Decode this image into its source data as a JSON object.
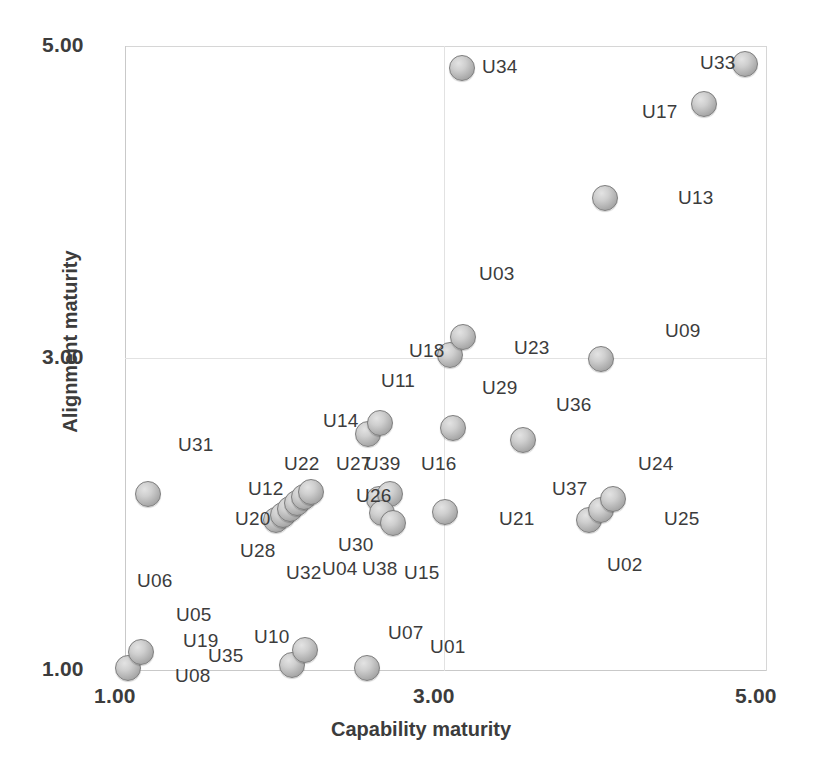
{
  "chart_data": {
    "type": "scatter",
    "title": "",
    "xlabel": "Capability maturity",
    "ylabel": "Alignment maturity",
    "xlim": [
      1.0,
      5.0
    ],
    "ylim": [
      1.0,
      5.0
    ],
    "xticks": [
      "1.00",
      "3.00",
      "5.00"
    ],
    "yticks": [
      "1.00",
      "3.00",
      "5.00"
    ],
    "xtick_values": [
      1.0,
      3.0,
      5.0
    ],
    "ytick_values": [
      1.0,
      3.0,
      5.0
    ],
    "grid": true,
    "legend": false,
    "marker": "circle-grey-3d",
    "points": [
      {
        "label": "U34",
        "x": 3.11,
        "y": 4.86,
        "px": 462,
        "py": 68,
        "lx": 482,
        "ly": 56,
        "anchor": "right"
      },
      {
        "label": "U33",
        "x": 4.87,
        "y": 4.88,
        "px": 745,
        "py": 64,
        "lx": 700,
        "ly": 52,
        "anchor": "left"
      },
      {
        "label": "U17",
        "x": 4.62,
        "y": 4.62,
        "px": 704,
        "py": 104,
        "lx": 642,
        "ly": 101,
        "anchor": "left"
      },
      {
        "label": "U13",
        "x": 4.0,
        "y": 4.02,
        "px": 605,
        "py": 198,
        "lx": 678,
        "ly": 187,
        "anchor": "right"
      },
      {
        "label": "U03",
        "x": 3.12,
        "y": 3.13,
        "px": 463,
        "py": 337,
        "lx": 479,
        "ly": 263,
        "anchor": "right"
      },
      {
        "label": "U18",
        "x": 3.03,
        "y": 3.02,
        "px": 450,
        "py": 355,
        "lx": 409,
        "ly": 340,
        "anchor": "left"
      },
      {
        "label": "U23",
        "x": 3.03,
        "y": 3.02,
        "px": 450,
        "py": 355,
        "lx": 514,
        "ly": 337,
        "anchor": "right"
      },
      {
        "label": "U09",
        "x": 3.98,
        "y": 3.0,
        "px": 601,
        "py": 359,
        "lx": 665,
        "ly": 320,
        "anchor": "right"
      },
      {
        "label": "U11",
        "x": 2.52,
        "y": 2.58,
        "px": 368,
        "py": 434,
        "lx": 381,
        "ly": 370,
        "anchor": "right"
      },
      {
        "label": "U29",
        "x": 3.06,
        "y": 2.55,
        "px": 453,
        "py": 428,
        "lx": 482,
        "ly": 377,
        "anchor": "right"
      },
      {
        "label": "U36",
        "x": 3.5,
        "y": 2.47,
        "px": 523,
        "py": 440,
        "lx": 556,
        "ly": 394,
        "anchor": "right"
      },
      {
        "label": "U14",
        "x": 2.45,
        "y": 2.57,
        "px": 368,
        "py": 434,
        "lx": 323,
        "ly": 410,
        "anchor": "left"
      },
      {
        "label": "U39",
        "x": 2.53,
        "y": 2.64,
        "px": 380,
        "py": 423,
        "lx": 365,
        "ly": 453,
        "anchor": "below"
      },
      {
        "label": "U16",
        "x": 3.06,
        "y": 2.55,
        "px": 453,
        "py": 428,
        "lx": 421,
        "ly": 453,
        "anchor": "below"
      },
      {
        "label": "U31",
        "x": 1.14,
        "y": 2.13,
        "px": 148,
        "py": 494,
        "lx": 178,
        "ly": 434,
        "anchor": "right"
      },
      {
        "label": "U24",
        "x": 3.93,
        "y": 2.18,
        "px": 597,
        "py": 522,
        "lx": 638,
        "ly": 453,
        "anchor": "right"
      },
      {
        "label": "U22",
        "x": 2.1,
        "y": 2.17,
        "px": 300,
        "py": 498,
        "lx": 284,
        "ly": 453,
        "anchor": "above"
      },
      {
        "label": "U27",
        "x": 2.4,
        "y": 2.13,
        "px": 385,
        "py": 500,
        "lx": 336,
        "ly": 453,
        "anchor": "left"
      },
      {
        "label": "U12",
        "x": 2.04,
        "y": 2.1,
        "px": 292,
        "py": 506,
        "lx": 248,
        "ly": 478,
        "anchor": "left"
      },
      {
        "label": "U26",
        "x": 2.42,
        "y": 2.12,
        "px": 387,
        "py": 503,
        "lx": 356,
        "ly": 485,
        "anchor": "left"
      },
      {
        "label": "U37",
        "x": 3.88,
        "y": 2.13,
        "px": 589,
        "py": 512,
        "lx": 552,
        "ly": 478,
        "anchor": "left"
      },
      {
        "label": "U21",
        "x": 3.0,
        "y": 2.01,
        "px": 445,
        "py": 512,
        "lx": 499,
        "ly": 508,
        "anchor": "right"
      },
      {
        "label": "U20",
        "x": 2.0,
        "y": 2.04,
        "px": 283,
        "py": 516,
        "lx": 235,
        "ly": 508,
        "anchor": "left"
      },
      {
        "label": "U06",
        "x": 1.14,
        "y": 2.13,
        "px": 148,
        "py": 494,
        "lx": 137,
        "ly": 570,
        "anchor": "below"
      },
      {
        "label": "U25",
        "x": 3.95,
        "y": 2.09,
        "px": 600,
        "py": 510,
        "lx": 664,
        "ly": 508,
        "anchor": "right"
      },
      {
        "label": "U30",
        "x": 2.42,
        "y": 2.0,
        "px": 387,
        "py": 519,
        "lx": 338,
        "ly": 534,
        "anchor": "left"
      },
      {
        "label": "U28",
        "x": 1.98,
        "y": 2.02,
        "px": 277,
        "py": 520,
        "lx": 240,
        "ly": 540,
        "anchor": "below"
      },
      {
        "label": "U04",
        "x": 2.38,
        "y": 2.0,
        "px": 383,
        "py": 520,
        "lx": 322,
        "ly": 558,
        "anchor": "below"
      },
      {
        "label": "U38",
        "x": 2.44,
        "y": 1.99,
        "px": 392,
        "py": 522,
        "lx": 362,
        "ly": 558,
        "anchor": "below"
      },
      {
        "label": "U32",
        "x": 2.02,
        "y": 2.0,
        "px": 286,
        "py": 520,
        "lx": 286,
        "ly": 562,
        "anchor": "below"
      },
      {
        "label": "U15",
        "x": 2.6,
        "y": 1.98,
        "px": 440,
        "py": 512,
        "lx": 404,
        "ly": 562,
        "anchor": "below"
      },
      {
        "label": "U02",
        "x": 3.9,
        "y": 2.0,
        "px": 592,
        "py": 520,
        "lx": 607,
        "ly": 554,
        "anchor": "below"
      },
      {
        "label": "U05",
        "x": 1.08,
        "y": 1.12,
        "px": 140,
        "py": 652,
        "lx": 176,
        "ly": 604,
        "anchor": "above"
      },
      {
        "label": "U19",
        "x": 1.08,
        "y": 1.12,
        "px": 140,
        "py": 652,
        "lx": 183,
        "ly": 630,
        "anchor": "right"
      },
      {
        "label": "U35",
        "x": 1.08,
        "y": 1.08,
        "px": 140,
        "py": 652,
        "lx": 208,
        "ly": 645,
        "anchor": "right"
      },
      {
        "label": "U08",
        "x": 1.02,
        "y": 1.0,
        "px": 128,
        "py": 668,
        "lx": 175,
        "ly": 665,
        "anchor": "right"
      },
      {
        "label": "U10",
        "x": 2.04,
        "y": 1.12,
        "px": 292,
        "py": 665,
        "lx": 254,
        "ly": 626,
        "anchor": "left"
      },
      {
        "label": "U07",
        "x": 2.5,
        "y": 1.0,
        "px": 367,
        "py": 668,
        "lx": 388,
        "ly": 622,
        "anchor": "above"
      },
      {
        "label": "U01",
        "x": 2.95,
        "y": 1.0,
        "px": 367,
        "py": 668,
        "lx": 430,
        "ly": 636,
        "anchor": "right"
      }
    ],
    "markers": [
      {
        "px": 462,
        "py": 68
      },
      {
        "px": 745,
        "py": 64
      },
      {
        "px": 704,
        "py": 104
      },
      {
        "px": 605,
        "py": 198
      },
      {
        "px": 450,
        "py": 355
      },
      {
        "px": 463,
        "py": 337
      },
      {
        "px": 601,
        "py": 359
      },
      {
        "px": 368,
        "py": 434
      },
      {
        "px": 380,
        "py": 423
      },
      {
        "px": 453,
        "py": 428
      },
      {
        "px": 523,
        "py": 440
      },
      {
        "px": 148,
        "py": 494
      },
      {
        "px": 276,
        "py": 520
      },
      {
        "px": 283,
        "py": 515
      },
      {
        "px": 290,
        "py": 509
      },
      {
        "px": 297,
        "py": 503
      },
      {
        "px": 304,
        "py": 497
      },
      {
        "px": 311,
        "py": 492
      },
      {
        "px": 379,
        "py": 499
      },
      {
        "px": 390,
        "py": 494
      },
      {
        "px": 382,
        "py": 513
      },
      {
        "px": 393,
        "py": 523
      },
      {
        "px": 445,
        "py": 512
      },
      {
        "px": 589,
        "py": 520
      },
      {
        "px": 601,
        "py": 510
      },
      {
        "px": 613,
        "py": 499
      },
      {
        "px": 128,
        "py": 668
      },
      {
        "px": 141,
        "py": 652
      },
      {
        "px": 292,
        "py": 665
      },
      {
        "px": 305,
        "py": 650
      },
      {
        "px": 367,
        "py": 668
      }
    ]
  },
  "axes": {
    "y_title": "Alignment maturity",
    "x_title": "Capability maturity",
    "y_tick_top": "5.00",
    "y_tick_mid": "3.00",
    "y_tick_bottom": "1.00",
    "x_tick_left": "1.00",
    "x_tick_mid": "3.00",
    "x_tick_right": "5.00"
  },
  "colors": {
    "marker_fill": "#cfcfcf",
    "marker_stroke": "#7d7d7d",
    "grid": "#e2e2e2",
    "frame": "#c9c9c9",
    "text": "#3c3c3c",
    "background": "#ffffff"
  }
}
